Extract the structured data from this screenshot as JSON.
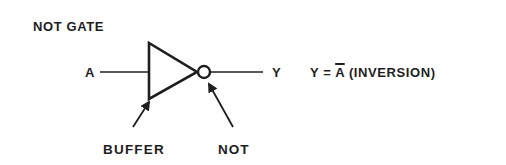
{
  "diagram": {
    "title": "NOT GATE",
    "input_label": "A",
    "output_label": "Y",
    "equation": {
      "lhs": "Y = ",
      "negated_var": "A",
      "rhs": " (INVERSION)"
    },
    "annotations": {
      "buffer": "BUFFER",
      "not": "NOT"
    },
    "colors": {
      "ink": "#1e1e1e",
      "background": "#ffffff"
    }
  }
}
